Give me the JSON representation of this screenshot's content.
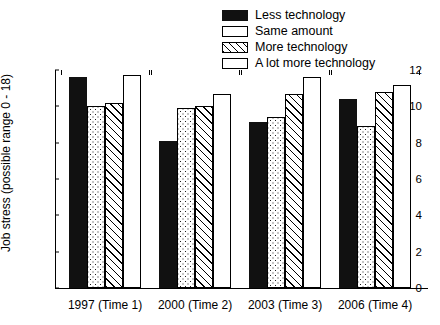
{
  "chart_data": {
    "type": "bar",
    "title": "",
    "subtitle": "",
    "xlabel": "",
    "ylabel": "Job stress (possible range 0 - 18)",
    "ylim": [
      0,
      12
    ],
    "ytick_labels": [
      "0",
      "2",
      "4",
      "6",
      "8",
      "10",
      "12"
    ],
    "ytick_values": [
      0,
      2,
      4,
      6,
      8,
      10,
      12
    ],
    "grid": false,
    "legend_position": "top-right",
    "categories": [
      "1997 (Time 1)",
      "2000 (Time 2)",
      "2003 (Time 3)",
      "2006 (Time 4)"
    ],
    "series": [
      {
        "name": "Less technology",
        "fill": "solid-black",
        "color": "#111111",
        "values": [
          11.6,
          8.1,
          9.15,
          10.4
        ]
      },
      {
        "name": "Same amount",
        "fill": "dotted",
        "color": "#ffffff",
        "values": [
          10.0,
          9.9,
          9.4,
          8.9
        ]
      },
      {
        "name": "More technology",
        "fill": "diagonal-hatch",
        "color": "#ffffff",
        "values": [
          10.2,
          10.0,
          10.7,
          10.8
        ]
      },
      {
        "name": "A lot more technology",
        "fill": "plain-white",
        "color": "#ffffff",
        "values": [
          11.7,
          10.7,
          11.6,
          11.2
        ]
      }
    ]
  },
  "legend": {
    "items": [
      {
        "label": "Less technology",
        "swatch": "swatch-solid-black"
      },
      {
        "label": "Same amount",
        "swatch": "swatch-dotted"
      },
      {
        "label": "More technology",
        "swatch": "swatch-hatched"
      },
      {
        "label": "A lot more technology",
        "swatch": "swatch-plain-white"
      }
    ]
  }
}
